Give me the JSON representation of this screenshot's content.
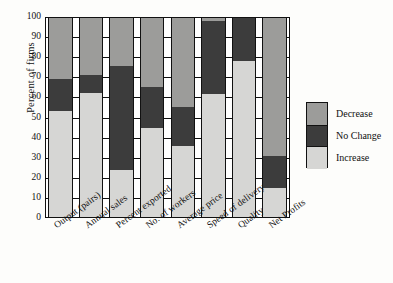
{
  "chart_data": {
    "type": "bar",
    "subtype": "stacked-bar-100-percent",
    "title": "",
    "xlabel": "",
    "ylabel": "Percent of firms",
    "ylim": [
      0,
      100
    ],
    "yticks": [
      0,
      10,
      20,
      30,
      40,
      50,
      60,
      70,
      80,
      90,
      100
    ],
    "grid": true,
    "grid_axis": "y",
    "legend_position": "right",
    "stack_order_bottom_to_top": [
      "Increase",
      "No Change",
      "Decrease"
    ],
    "categories": [
      "Output (pairs)",
      "Annual sales",
      "Percent exported",
      "No. of workers",
      "Average price",
      "Speed of delivery",
      "Quality",
      "Net Profits"
    ],
    "series": [
      {
        "name": "Increase",
        "color": "#d6d6d4",
        "values": [
          53,
          62,
          24,
          45,
          36,
          61.5,
          78,
          15
        ]
      },
      {
        "name": "No Change",
        "color": "#3c3c3c",
        "values": [
          16,
          9,
          51.5,
          20,
          19,
          36.5,
          22,
          16
        ]
      },
      {
        "name": "Decrease",
        "color": "#9c9c9a",
        "values": [
          31,
          29,
          24.5,
          35,
          45,
          2,
          0,
          69
        ]
      }
    ],
    "cumulative_tops": {
      "increase": [
        53,
        62,
        24,
        45,
        36,
        61.5,
        78,
        15
      ],
      "no_change": [
        69,
        71,
        75.5,
        65,
        55,
        98,
        100,
        31
      ],
      "decrease": [
        100,
        100,
        100,
        100,
        100,
        100,
        100,
        100
      ]
    }
  },
  "axis": {
    "y_title": "Percent of firms",
    "y_tick_labels": [
      "100",
      "90",
      "80",
      "70",
      "60",
      "50",
      "40",
      "30",
      "20",
      "10",
      "0"
    ]
  },
  "legend": {
    "items": [
      {
        "label": "Decrease",
        "color": "#9c9c9a"
      },
      {
        "label": "No Change",
        "color": "#3c3c3c"
      },
      {
        "label": "Increase",
        "color": "#d6d6d4"
      }
    ]
  },
  "x_labels": [
    "Output (pairs)",
    "Annual sales",
    "Percent exported",
    "No. of workers",
    "Average price",
    "Speed of delivery",
    "Quality",
    "Net Profits"
  ]
}
